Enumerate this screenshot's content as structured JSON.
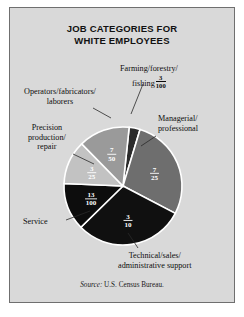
{
  "figure": {
    "title_line1": "JOB CATEGORIES FOR",
    "title_line2": "WHITE EMPLOYEES",
    "source_prefix": "Source:",
    "source_text": " U.S. Census Bureau.",
    "background_color": "#d9d9d9",
    "border_color": "#6f6f6f"
  },
  "labels": {
    "farming_line1": "Farming/forestry/",
    "farming_line2": "fishing",
    "farming_num": "3",
    "farming_den": "100",
    "operators_line1": "Operators/fabricators/",
    "operators_line2": "laborers",
    "precision_line1": "Precision",
    "precision_line2": "production/",
    "precision_line3": "repair",
    "managerial_line1": "Managerial/",
    "managerial_line2": "professional",
    "service": "Service",
    "technical_line1": "Technical/sales/",
    "technical_line2": "administrative support"
  },
  "chart_data": {
    "type": "pie",
    "title": "JOB CATEGORIES FOR WHITE EMPLOYEES",
    "source": "Source: U.S. Census Bureau.",
    "units": "fraction of white employees",
    "total": 1.0,
    "legend": "labels with leader lines around pie",
    "categories": [
      "Farming/forestry/fishing",
      "Managerial/professional",
      "Technical/sales/administrative support",
      "Service",
      "Precision production/repair",
      "Operators/fabricators/laborers"
    ],
    "values": [
      0.03,
      0.28,
      0.3,
      0.13,
      0.12,
      0.14
    ],
    "value_labels": [
      "3/100",
      "7/25",
      "3/10",
      "13/100",
      "3/25",
      "7/50"
    ],
    "slices": [
      {
        "name": "Farming/forestry/fishing",
        "fraction_num": "3",
        "fraction_den": "100",
        "value": 0.03,
        "percent": 3,
        "color": "#2b2b2b",
        "label_color": "#ffffff",
        "label_inside": false
      },
      {
        "name": "Managerial/professional",
        "fraction_num": "7",
        "fraction_den": "25",
        "value": 0.28,
        "percent": 28,
        "color": "#6e6e6e",
        "label_color": "#ffffff",
        "label_inside": true
      },
      {
        "name": "Technical/sales/administrative support",
        "fraction_num": "3",
        "fraction_den": "10",
        "value": 0.3,
        "percent": 30,
        "color": "#101010",
        "label_color": "#ffffff",
        "label_inside": true
      },
      {
        "name": "Service",
        "fraction_num": "13",
        "fraction_den": "100",
        "value": 0.13,
        "percent": 13,
        "color": "#0d0d0d",
        "label_color": "#ffffff",
        "label_inside": true
      },
      {
        "name": "Precision production/repair",
        "fraction_num": "3",
        "fraction_den": "25",
        "value": 0.12,
        "percent": 12,
        "color": "#c2c2c2",
        "label_color": "#ffffff",
        "label_inside": true
      },
      {
        "name": "Operators/fabricators/laborers",
        "fraction_num": "7",
        "fraction_den": "50",
        "value": 0.14,
        "percent": 14,
        "color": "#9a9a9a",
        "label_color": "#ffffff",
        "label_inside": true
      }
    ]
  }
}
